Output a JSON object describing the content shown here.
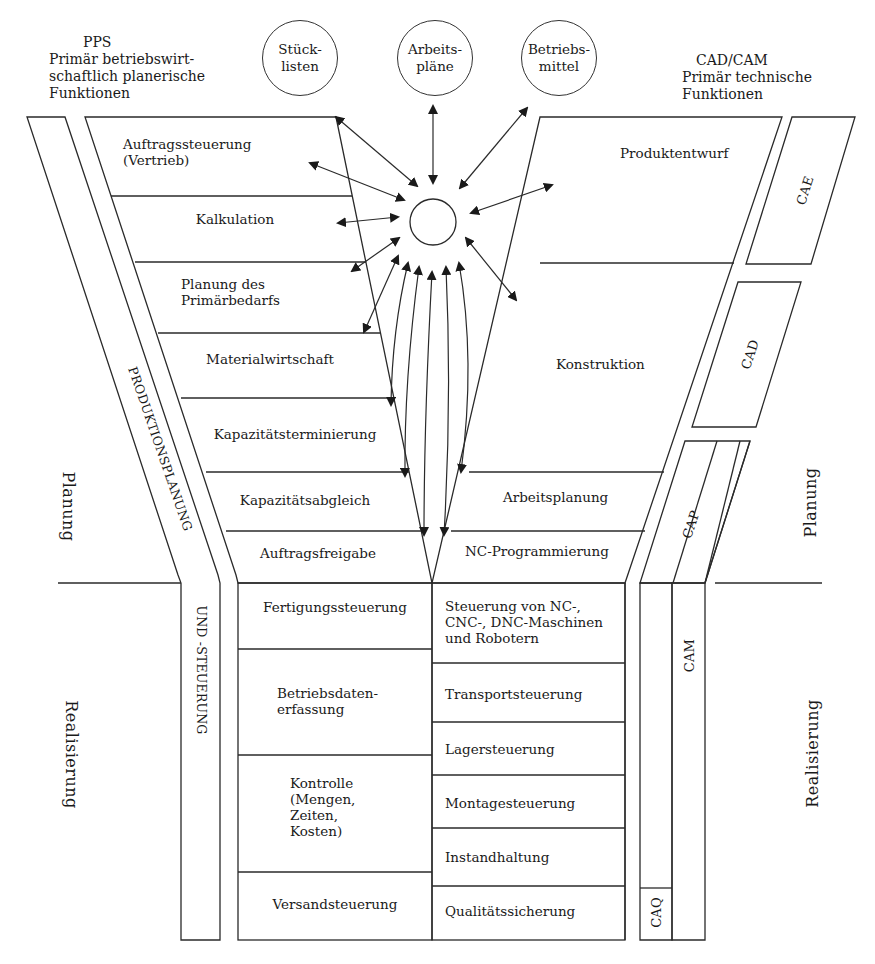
{
  "header": {
    "left": {
      "title": "PPS",
      "subtitle": "Primär betriebswirt-\nschaftlich planerische\nFunktionen"
    },
    "right": {
      "title": "CAD/CAM",
      "subtitle": "Primär technische\nFunktionen"
    }
  },
  "databases": [
    {
      "label": "Stück-\nlisten"
    },
    {
      "label": "Arbeits-\npläne"
    },
    {
      "label": "Betriebs-\nmittel"
    }
  ],
  "left_funnel": {
    "band_label": "PRODUKTIONSPLANUNG",
    "rows": [
      {
        "label": "Auftragssteuerung\n(Vertrieb)"
      },
      {
        "label": "Kalkulation"
      },
      {
        "label": "Planung des\nPrimärbedarfs"
      },
      {
        "label": "Materialwirtschaft"
      },
      {
        "label": "Kapazitätsterminierung"
      },
      {
        "label": "Kapazitätsabgleich"
      },
      {
        "label": "Auftragsfreigabe"
      }
    ]
  },
  "right_funnel": {
    "rows": [
      {
        "label": "Produktentwurf"
      },
      {
        "label": "Konstruktion"
      },
      {
        "label": "Arbeitsplanung"
      },
      {
        "label": "NC-Programmierung"
      }
    ],
    "bands": {
      "cae": "CAE",
      "cad": "CAD",
      "cap": "CAP"
    }
  },
  "lower_left": {
    "band_label": "UND  -STEUERUNG",
    "rows": [
      {
        "label": "Fertigungssteuerung"
      },
      {
        "label": "Betriebsdaten-\nerfassung"
      },
      {
        "label": "Kontrolle\n(Mengen,\nZeiten,\nKosten)"
      },
      {
        "label": "Versandsteuerung"
      }
    ]
  },
  "lower_right": {
    "rows": [
      {
        "label": "Steuerung von NC-,\nCNC-, DNC-Maschinen\nund Robotern"
      },
      {
        "label": "Transportsteuerung"
      },
      {
        "label": "Lagersteuerung"
      },
      {
        "label": "Montagesteuerung"
      },
      {
        "label": "Instandhaltung"
      },
      {
        "label": "Qualitätssicherung"
      }
    ],
    "bands": {
      "cam": "CAM",
      "caq": "CAQ"
    }
  },
  "phases": {
    "left_top": "Planung",
    "left_bottom": "Realisierung",
    "right_top": "Planung",
    "right_bottom": "Realisierung"
  },
  "colors": {
    "line": "#2a2a2a",
    "background": "#ffffff"
  }
}
